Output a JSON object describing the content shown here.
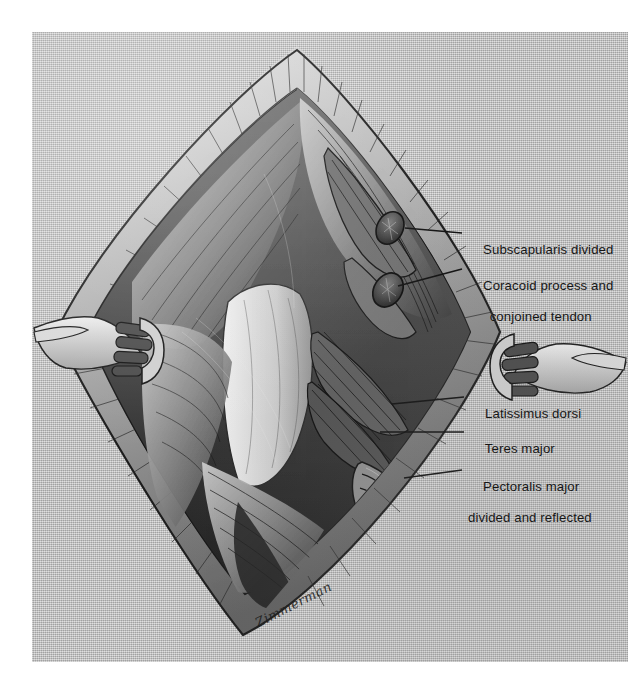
{
  "figure": {
    "kind": "surgical-illustration",
    "medium": "halftone pen-and-ink wash",
    "plate_background_color": "#b9b9b9",
    "ink_color": "#1a1a1a",
    "paper_color": "#ffffff"
  },
  "artist": {
    "signature": "Zimmerman"
  },
  "labels": [
    {
      "id": "subscapularis",
      "lines": [
        "Subscapularis divided"
      ]
    },
    {
      "id": "coracoid",
      "lines": [
        "Coracoid process and",
        "conjoined tendon"
      ]
    },
    {
      "id": "latissimus",
      "lines": [
        "Latissimus dorsi"
      ]
    },
    {
      "id": "teres-major",
      "lines": [
        "Teres major"
      ]
    },
    {
      "id": "pectoralis",
      "lines": [
        "Pectoralis major",
        "divided and reflected"
      ]
    }
  ],
  "leader_lines": [
    {
      "id": "leader-subscapularis",
      "x1": 405,
      "y1": 228,
      "x2": 462,
      "y2": 233
    },
    {
      "id": "leader-coracoid",
      "x1": 398,
      "y1": 286,
      "x2": 462,
      "y2": 269
    },
    {
      "id": "leader-latissimus",
      "x1": 392,
      "y1": 404,
      "x2": 464,
      "y2": 397
    },
    {
      "id": "leader-teres-major",
      "x1": 380,
      "y1": 432,
      "x2": 464,
      "y2": 432
    },
    {
      "id": "leader-pectoralis",
      "x1": 404,
      "y1": 478,
      "x2": 462,
      "y2": 470
    }
  ]
}
